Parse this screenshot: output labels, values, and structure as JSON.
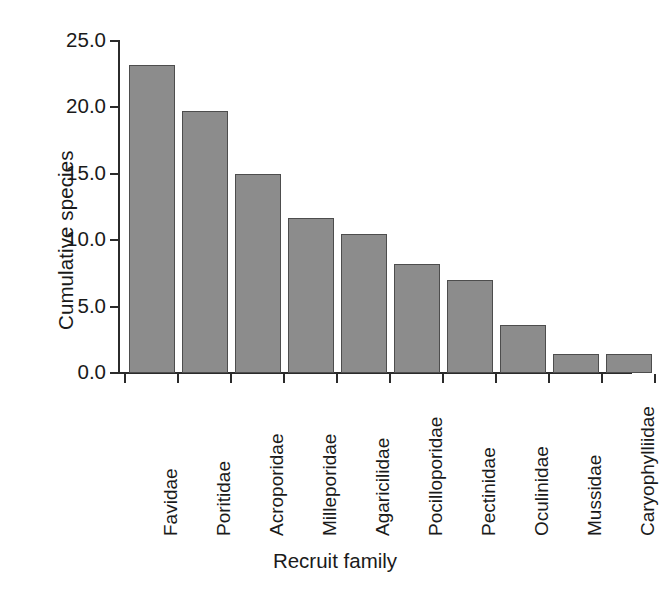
{
  "chart_data": {
    "type": "bar",
    "title": "",
    "xlabel": "Recruit family",
    "ylabel": "Cumulative species",
    "categories": [
      "Favidae",
      "Poritidae",
      "Acroporidae",
      "Milleporidae",
      "Agaricilidae",
      "Pocilloporidae",
      "Pectinidae",
      "Oculinidae",
      "Mussidae",
      "Caryophylliidae"
    ],
    "values": [
      23.2,
      19.7,
      15.0,
      11.7,
      10.5,
      8.2,
      7.0,
      3.6,
      1.4,
      1.4
    ],
    "ylim": [
      0.0,
      25.0
    ],
    "ytick_labels": [
      "0.0",
      "5.0",
      "10.0",
      "15.0",
      "20.0",
      "25.0"
    ],
    "ytick_values": [
      0.0,
      5.0,
      10.0,
      15.0,
      20.0,
      25.0
    ],
    "grid": false,
    "legend": null,
    "bar_color": "#8c8c8c",
    "bar_edge_color": "#4d4d4d",
    "axis_color": "#2b2b2b",
    "background_color": "#ffffff",
    "text_color": "#1a1a1a"
  }
}
